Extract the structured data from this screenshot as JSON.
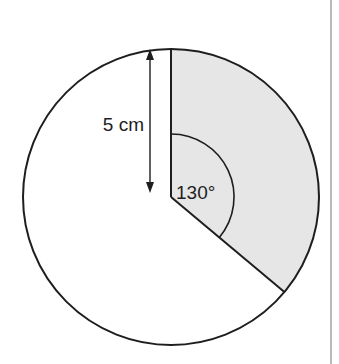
{
  "diagram": {
    "type": "circle-sector",
    "radius_label": "5 cm",
    "angle_label": "130°",
    "radius_value_cm": 5,
    "sector_angle_deg": 130,
    "colors": {
      "stroke": "#1e1e1e",
      "sector_fill": "#e6e6e6",
      "background": "#ffffff",
      "side_rule": "#8a8a8a"
    }
  }
}
